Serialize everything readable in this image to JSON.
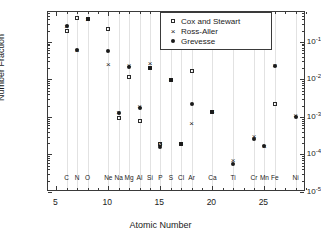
{
  "chart_data": {
    "type": "scatter",
    "title": "",
    "xlabel": "Atomic Number",
    "ylabel": "Number Fraction",
    "xlim": [
      4.2,
      29.0
    ],
    "ylim": [
      1e-05,
      0.62
    ],
    "yscale": "log",
    "grid": "vertical-light",
    "legend_position": "top-right",
    "xticks": [
      5,
      10,
      15,
      20,
      25
    ],
    "yticks": [
      "10^-1",
      "10^-2",
      "10^-3",
      "10^-4",
      "10^-5"
    ],
    "ytick_labels": [
      {
        "mantissa": "10",
        "exponent": "-1",
        "value": 0.1
      },
      {
        "mantissa": "10",
        "exponent": "-2",
        "value": 0.01
      },
      {
        "mantissa": "10",
        "exponent": "-3",
        "value": 0.001
      },
      {
        "mantissa": "10",
        "exponent": "-4",
        "value": 0.0001
      },
      {
        "mantissa": "10",
        "exponent": "-5",
        "value": 1e-05
      }
    ],
    "element_labels": [
      {
        "symbol": "C",
        "z": 6
      },
      {
        "symbol": "N",
        "z": 7
      },
      {
        "symbol": "O",
        "z": 8
      },
      {
        "symbol": "Ne",
        "z": 10
      },
      {
        "symbol": "Na",
        "z": 11
      },
      {
        "symbol": "Mg",
        "z": 12
      },
      {
        "symbol": "Al",
        "z": 13
      },
      {
        "symbol": "Si",
        "z": 14
      },
      {
        "symbol": "P",
        "z": 15
      },
      {
        "symbol": "S",
        "z": 16
      },
      {
        "symbol": "Cl",
        "z": 17
      },
      {
        "symbol": "Ar",
        "z": 18
      },
      {
        "symbol": "Ca",
        "z": 20
      },
      {
        "symbol": "Ti",
        "z": 22
      },
      {
        "symbol": "Cr",
        "z": 24
      },
      {
        "symbol": "Mn",
        "z": 25
      },
      {
        "symbol": "Fe",
        "z": 26
      },
      {
        "symbol": "Ni",
        "z": 28
      }
    ],
    "series": [
      {
        "name": "Cox and Stewart",
        "marker": "open-square",
        "color": "#2b2b2b",
        "points": [
          {
            "z": 6,
            "value": 0.19
          },
          {
            "z": 7,
            "value": 0.43
          },
          {
            "z": 8,
            "value": 0.4
          },
          {
            "z": 10,
            "value": 0.22
          },
          {
            "z": 11,
            "value": 0.00095
          },
          {
            "z": 12,
            "value": 0.0118
          },
          {
            "z": 13,
            "value": 0.00078
          },
          {
            "z": 14,
            "value": 0.0195
          },
          {
            "z": 15,
            "value": 0.000195
          },
          {
            "z": 16,
            "value": 0.0098
          },
          {
            "z": 17,
            "value": 0.000195
          },
          {
            "z": 18,
            "value": 0.0163
          },
          {
            "z": 20,
            "value": 0.00138
          },
          {
            "z": 26,
            "value": 0.0022
          }
        ]
      },
      {
        "name": "Ross-Aller",
        "marker": "cross",
        "color": "#1a1a1a",
        "points": [
          {
            "z": 6,
            "value": 0.27
          },
          {
            "z": 7,
            "value": 0.06
          },
          {
            "z": 8,
            "value": 0.4
          },
          {
            "z": 10,
            "value": 0.0255
          },
          {
            "z": 11,
            "value": 0.00132
          },
          {
            "z": 12,
            "value": 0.0245
          },
          {
            "z": 13,
            "value": 0.0019
          },
          {
            "z": 14,
            "value": 0.028
          },
          {
            "z": 15,
            "value": 0.000205
          },
          {
            "z": 16,
            "value": 0.0105
          },
          {
            "z": 17,
            "value": 0.0002
          },
          {
            "z": 18,
            "value": 0.00068
          },
          {
            "z": 20,
            "value": 0.0014
          },
          {
            "z": 22,
            "value": 7e-05
          },
          {
            "z": 24,
            "value": 0.00032
          },
          {
            "z": 25,
            "value": 0.00017
          },
          {
            "z": 26,
            "value": 0.024
          },
          {
            "z": 28,
            "value": 0.00115
          }
        ]
      },
      {
        "name": "Grevesse",
        "marker": "filled-dot",
        "color": "#1a1a1a",
        "points": [
          {
            "z": 6,
            "value": 0.27
          },
          {
            "z": 7,
            "value": 0.06
          },
          {
            "z": 8,
            "value": 0.41
          },
          {
            "z": 10,
            "value": 0.058
          },
          {
            "z": 11,
            "value": 0.00128
          },
          {
            "z": 12,
            "value": 0.0215
          },
          {
            "z": 13,
            "value": 0.0017
          },
          {
            "z": 14,
            "value": 0.0205
          },
          {
            "z": 15,
            "value": 0.000155
          },
          {
            "z": 16,
            "value": 0.0098
          },
          {
            "z": 17,
            "value": 0.000188
          },
          {
            "z": 18,
            "value": 0.00215
          },
          {
            "z": 20,
            "value": 0.00135
          },
          {
            "z": 22,
            "value": 5.7e-05
          },
          {
            "z": 24,
            "value": 0.000265
          },
          {
            "z": 25,
            "value": 0.000165
          },
          {
            "z": 26,
            "value": 0.0225
          },
          {
            "z": 28,
            "value": 0.001
          }
        ]
      }
    ],
    "legend": [
      {
        "label": "Cox and Stewart",
        "marker": "open-square"
      },
      {
        "label": "Ross-Aller",
        "marker": "cross"
      },
      {
        "label": "Grevesse",
        "marker": "filled-dot"
      }
    ]
  }
}
